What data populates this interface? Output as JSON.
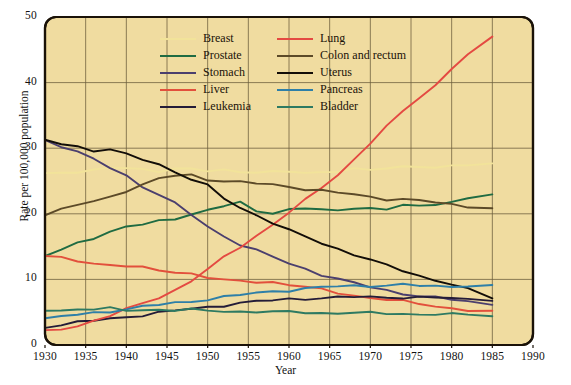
{
  "chart_data": {
    "type": "line",
    "title": "",
    "xlabel": "Year",
    "ylabel": "Rate per 100,000 population",
    "xlim": [
      1930,
      1990
    ],
    "ylim": [
      0,
      50
    ],
    "xticks": [
      1930,
      1935,
      1940,
      1945,
      1950,
      1955,
      1960,
      1965,
      1970,
      1975,
      1980,
      1985,
      1990
    ],
    "yticks": [
      0,
      10,
      20,
      30,
      40,
      50
    ],
    "grid": true,
    "legend_position": "top-center",
    "plot_background": "#f0dca0",
    "x": [
      1930,
      1932,
      1934,
      1936,
      1938,
      1940,
      1942,
      1944,
      1946,
      1948,
      1950,
      1952,
      1954,
      1956,
      1958,
      1960,
      1962,
      1964,
      1966,
      1968,
      1970,
      1972,
      1974,
      1976,
      1978,
      1980,
      1982,
      1985
    ],
    "series": [
      {
        "name": "Breast",
        "color": "#f2e39a",
        "values": [
          26.2,
          26.3,
          26.5,
          26.6,
          26.9,
          27.0,
          26.8,
          26.6,
          26.9,
          26.7,
          26.5,
          26.7,
          26.5,
          26.4,
          26.3,
          26.4,
          26.2,
          26.4,
          26.6,
          26.8,
          26.6,
          26.9,
          27.2,
          27.4,
          27.0,
          27.2,
          27.4,
          27.6
        ]
      },
      {
        "name": "Prostate",
        "color": "#1f6b42",
        "values": [
          13.6,
          14.4,
          15.5,
          16.4,
          17.3,
          18.1,
          18.3,
          18.8,
          19.3,
          20.0,
          20.6,
          21.2,
          21.6,
          20.4,
          20.2,
          20.7,
          20.9,
          20.5,
          20.4,
          21.0,
          20.9,
          20.7,
          21.3,
          21.0,
          21.5,
          21.9,
          22.4,
          23.0
        ]
      },
      {
        "name": "Stomach",
        "color": "#4b3f6e",
        "values": [
          31.2,
          30.4,
          29.5,
          28.2,
          27.0,
          25.8,
          24.2,
          23.0,
          21.5,
          19.8,
          18.0,
          16.6,
          15.4,
          14.4,
          13.4,
          12.4,
          11.6,
          10.8,
          10.1,
          9.4,
          8.8,
          8.3,
          7.9,
          7.5,
          7.2,
          6.9,
          6.6,
          6.2
        ]
      },
      {
        "name": "Liver",
        "color": "#e2503c",
        "values": [
          13.5,
          13.2,
          12.9,
          12.5,
          12.2,
          12.0,
          11.7,
          11.4,
          11.2,
          10.9,
          10.3,
          9.8,
          9.7,
          9.7,
          9.6,
          9.2,
          8.8,
          8.4,
          8.0,
          7.6,
          7.2,
          6.9,
          6.6,
          6.3,
          6.0,
          5.6,
          5.3,
          5.0
        ]
      },
      {
        "name": "Leukemia",
        "color": "#241c38",
        "values": [
          2.8,
          3.1,
          3.4,
          3.7,
          4.0,
          4.3,
          4.6,
          4.9,
          5.2,
          5.5,
          5.8,
          6.1,
          6.4,
          6.6,
          6.8,
          7.0,
          7.1,
          7.2,
          7.2,
          7.3,
          7.3,
          7.3,
          7.3,
          7.2,
          7.2,
          7.1,
          7.0,
          7.0
        ]
      },
      {
        "name": "Lung",
        "color": "#e44a42",
        "values": [
          2.0,
          2.4,
          3.0,
          3.7,
          4.5,
          5.4,
          6.3,
          7.3,
          8.4,
          9.8,
          11.5,
          13.3,
          15.0,
          16.7,
          18.4,
          20.2,
          22.0,
          24.0,
          26.0,
          28.3,
          30.8,
          33.2,
          35.6,
          37.8,
          39.6,
          42.2,
          44.2,
          46.8
        ]
      },
      {
        "name": "Colon and rectum",
        "color": "#5c4a28",
        "values": [
          20.0,
          20.6,
          21.3,
          21.9,
          22.6,
          23.6,
          24.4,
          25.3,
          25.8,
          25.9,
          25.3,
          25.0,
          24.8,
          24.6,
          24.4,
          24.2,
          23.8,
          23.5,
          23.2,
          22.9,
          22.6,
          22.3,
          22.2,
          22.0,
          21.7,
          21.4,
          21.2,
          20.9
        ]
      },
      {
        "name": "Uterus",
        "color": "#120d08",
        "values": [
          31.2,
          30.8,
          30.3,
          29.6,
          29.7,
          29.0,
          28.4,
          27.6,
          26.4,
          25.2,
          24.2,
          22.4,
          21.0,
          19.8,
          18.6,
          17.4,
          16.5,
          15.6,
          14.7,
          13.8,
          12.9,
          12.1,
          11.4,
          10.6,
          9.9,
          9.2,
          8.4,
          7.2
        ]
      },
      {
        "name": "Pancreas",
        "color": "#2e7fa8",
        "values": [
          4.0,
          4.3,
          4.6,
          4.9,
          5.2,
          5.5,
          5.8,
          6.1,
          6.4,
          6.7,
          7.0,
          7.3,
          7.6,
          7.9,
          8.2,
          8.4,
          8.6,
          8.8,
          8.9,
          9.0,
          9.1,
          9.1,
          9.2,
          9.0,
          8.9,
          9.0,
          9.1,
          9.0
        ]
      },
      {
        "name": "Bladder",
        "color": "#2e7a62",
        "values": [
          5.4,
          5.3,
          5.5,
          5.4,
          5.5,
          5.3,
          5.4,
          5.4,
          5.3,
          5.3,
          5.2,
          5.2,
          5.1,
          5.1,
          5.0,
          5.0,
          5.0,
          4.9,
          4.9,
          4.9,
          4.8,
          4.8,
          4.8,
          4.7,
          4.7,
          4.6,
          4.6,
          4.5
        ]
      }
    ],
    "legend": [
      {
        "label": "Breast",
        "color": "#f2e39a"
      },
      {
        "label": "Lung",
        "color": "#e44a42"
      },
      {
        "label": "Prostate",
        "color": "#1f6b42"
      },
      {
        "label": "Colon and rectum",
        "color": "#5c4a28"
      },
      {
        "label": "Stomach",
        "color": "#4b3f6e"
      },
      {
        "label": "Uterus",
        "color": "#120d08"
      },
      {
        "label": "Liver",
        "color": "#e2503c"
      },
      {
        "label": "Pancreas",
        "color": "#2e7fa8"
      },
      {
        "label": "Leukemia",
        "color": "#241c38"
      },
      {
        "label": "Bladder",
        "color": "#2e7a62"
      }
    ]
  }
}
